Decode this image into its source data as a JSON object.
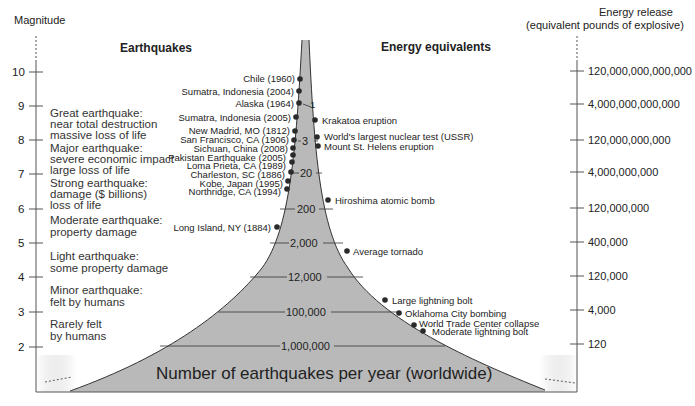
{
  "left_axis": {
    "title": "Magnitude",
    "ticks": [
      "10",
      "9",
      "8",
      "7",
      "6",
      "5",
      "4",
      "3",
      "2"
    ]
  },
  "right_axis": {
    "title_line1": "Energy release",
    "title_line2": "(equivalent pounds of explosive)",
    "ticks": [
      "120,000,000,000,000",
      "4,000,000,000,000",
      "120,000,000,000",
      "4,000,000,000",
      "120,000,000",
      "400,000",
      "120,000",
      "4,000",
      "120"
    ]
  },
  "headers": {
    "earthquakes": "Earthquakes",
    "energy_equivalents": "Energy equivalents"
  },
  "descriptions": [
    {
      "line1": "Great earthquake:",
      "line2": "near total destruction",
      "line3": "massive loss of life"
    },
    {
      "line1": "Major earthquake:",
      "line2": "severe economic impact",
      "line3": "large loss of life"
    },
    {
      "line1": "Strong earthquake:",
      "line2": "damage ($ billions)",
      "line3": "loss of life"
    },
    {
      "line1": "Moderate earthquake:",
      "line2": "property damage"
    },
    {
      "line1": "Light earthquake:",
      "line2": "some property damage"
    },
    {
      "line1": "Minor earthquake:",
      "line2": "felt by humans"
    },
    {
      "line1": "Rarely felt",
      "line2": "by humans"
    }
  ],
  "earthquakes": [
    "Chile (1960)",
    "Sumatra, Indonesia (2004)",
    "Alaska (1964)",
    "Sumatra, Indonesia (2005)",
    "New Madrid, MO (1812)",
    "San Francisco, CA (1906)",
    "Sichuan, China (2008)",
    "Pakistan Earthquake (2005)",
    "Loma Prieta, CA (1989)",
    "Charleston, SC (1886)",
    "Kobe, Japan (1995)",
    "Northridge, CA (1994)",
    "Long Island, NY (1884)"
  ],
  "energy_equivalents": [
    "Krakatoa eruption",
    "World's largest nuclear test (USSR)",
    "Mount St. Helens eruption",
    "Hiroshima atomic bomb",
    "Average tornado",
    "Large lightning bolt",
    "Oklahoma City bombing",
    "World Trade Center collapse",
    "Moderate lightning bolt"
  ],
  "frequency_bands": [
    "1",
    "3",
    "20",
    "200",
    "2,000",
    "12,000",
    "100,000",
    "1,000,000"
  ],
  "funnel_caption": "Number of earthquakes per year (worldwide)",
  "colors": {
    "funnel_fill": "#b9b9b9",
    "line": "#333333",
    "dot": "#2a2a2a"
  }
}
